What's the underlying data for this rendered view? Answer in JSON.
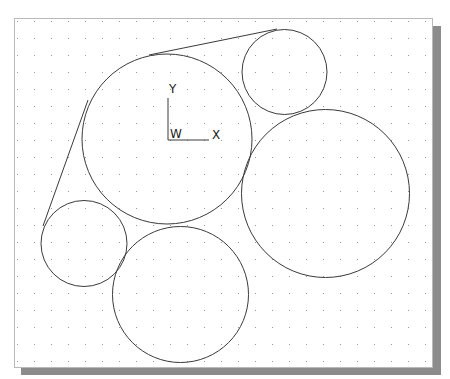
{
  "viewport": {
    "grid_spacing": 17,
    "grid_origin": [
      14,
      18
    ],
    "frame": {
      "x": 14,
      "y": 18,
      "w": 419,
      "h": 350
    },
    "colors": {
      "background": "#ffffff",
      "frame_border": "#b9b9b9",
      "shadow": "#8c8c8c",
      "geometry": "#3a3a3a",
      "grid_dot": "#9a9a9a"
    }
  },
  "ucs_icon": {
    "y_label": "Y",
    "x_label": "X",
    "w_label": "W"
  },
  "geometry": {
    "circles": [
      {
        "name": "large-circle",
        "cx": 167,
        "cy": 139,
        "r": 85
      },
      {
        "name": "top-right-small-circle",
        "cx": 284.5,
        "cy": 72,
        "r": 42.5
      },
      {
        "name": "right-large-circle",
        "cx": 325.5,
        "cy": 193.5,
        "r": 84
      },
      {
        "name": "left-small-circle",
        "cx": 84,
        "cy": 243.5,
        "r": 43
      },
      {
        "name": "bottom-circle",
        "cx": 180.5,
        "cy": 294.5,
        "r": 68
      }
    ],
    "lines": [
      {
        "name": "top-tangent-line",
        "x1": 149,
        "y1": 55,
        "x2": 277,
        "y2": 29
      },
      {
        "name": "left-tangent-line",
        "x1": 88,
        "y1": 100,
        "x2": 43,
        "y2": 226
      }
    ]
  }
}
